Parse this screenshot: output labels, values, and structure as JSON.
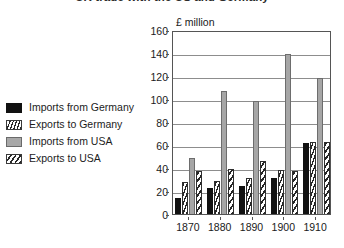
{
  "chart_title": "UK trade with the US and Germany",
  "unit_label": "£ million",
  "legend": {
    "items": [
      {
        "label": "Imports from Germany",
        "pattern": "solid-black",
        "color": "#111111"
      },
      {
        "label": "Exports to Germany",
        "pattern": "vertical-hatch",
        "color": "#262626"
      },
      {
        "label": "Imports from USA",
        "pattern": "solid-gray",
        "color": "#a6a6a6"
      },
      {
        "label": "Exports to USA",
        "pattern": "diagonal-hatch",
        "color": "#262626"
      }
    ]
  },
  "yaxis": {
    "ticks": [
      "0",
      "20",
      "40",
      "60",
      "80",
      "100",
      "120",
      "140",
      "160"
    ]
  },
  "xaxis": {
    "ticks": [
      "1870",
      "1880",
      "1890",
      "1900",
      "1910"
    ]
  },
  "chart_data": {
    "type": "bar",
    "title": "UK trade with the US and Germany",
    "xlabel": "",
    "ylabel": "£ million",
    "ylim": [
      0,
      160
    ],
    "ytick_step": 20,
    "grid": true,
    "legend_position": "left",
    "categories": [
      "1870",
      "1880",
      "1890",
      "1900",
      "1910"
    ],
    "series": [
      {
        "name": "Imports from Germany",
        "values": [
          14,
          23,
          24,
          31,
          62
        ]
      },
      {
        "name": "Exports to Germany",
        "values": [
          28,
          29,
          31,
          38,
          63
        ]
      },
      {
        "name": "Imports from USA",
        "values": [
          49,
          107,
          98,
          139,
          118
        ]
      },
      {
        "name": "Exports to USA",
        "values": [
          37,
          39,
          46,
          37,
          63
        ]
      }
    ]
  }
}
